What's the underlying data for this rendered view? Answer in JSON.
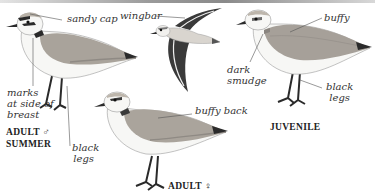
{
  "plate": {
    "background": "#ffffff",
    "birds": [
      {
        "id": "adult-male-summer",
        "caption": [
          "ADULT ♂",
          "SUMMER"
        ],
        "annotations": {
          "cap": "sandy cap",
          "marks": [
            "marks",
            "at side of",
            "breast"
          ],
          "legs": [
            "black",
            "legs"
          ]
        }
      },
      {
        "id": "flight",
        "annotations": {
          "wingbar": "wingbar"
        }
      },
      {
        "id": "juvenile",
        "caption": [
          "JUVENILE"
        ],
        "annotations": {
          "buffy": "buffy",
          "smudge": [
            "dark",
            "smudge"
          ],
          "legs": [
            "black",
            "legs"
          ]
        }
      },
      {
        "id": "adult-female",
        "caption": [
          "ADULT ♀"
        ],
        "annotations": {
          "back": "buffy back"
        }
      }
    ]
  },
  "colors": {
    "ink": "#222222",
    "leader": "#555555",
    "back": "#a9a39b",
    "back_dark": "#8f8a84",
    "white": "#f7f7f5",
    "legs": "#2a2a2a"
  }
}
